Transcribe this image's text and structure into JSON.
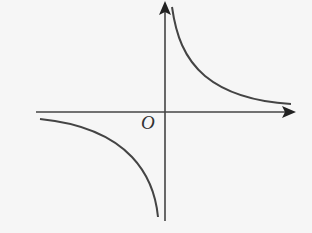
{
  "figure": {
    "origin_label": "O",
    "colors": {
      "background": "#f6f6f6",
      "stroke": "#444444"
    },
    "axes": {
      "x_axis": {
        "from": [
          36,
          112
        ],
        "to": [
          295,
          112
        ]
      },
      "y_axis": {
        "from": [
          165,
          221
        ],
        "to": [
          165,
          2
        ]
      }
    },
    "branches": [
      {
        "quadrant": "I",
        "path": "M172,7 C176,35 184,58 205,76 C228,95 258,102 291,104"
      },
      {
        "quadrant": "III",
        "path": "M40,119 C80,123 112,136 132,157 C148,174 156,196 158,217"
      }
    ]
  }
}
